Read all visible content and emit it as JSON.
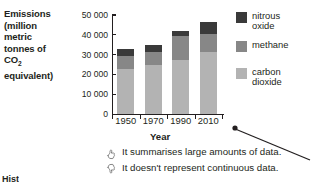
{
  "chart_data": {
    "type": "bar",
    "stacked": true,
    "title": "",
    "xlabel": "Year",
    "ylabel": "Emissions (million metric tonnes of CO2 equivalent)",
    "categories": [
      "1950",
      "1970",
      "1990",
      "2010"
    ],
    "series": [
      {
        "name": "carbon dioxide",
        "color": "#b3b3b3",
        "values": [
          22500,
          25000,
          27500,
          31500
        ]
      },
      {
        "name": "methane",
        "color": "#878787",
        "values": [
          7000,
          6500,
          12000,
          9000
        ]
      },
      {
        "name": "nitrous oxide",
        "color": "#3a3a3a",
        "values": [
          3500,
          3500,
          2500,
          6000
        ]
      }
    ],
    "totals": [
      33000,
      35000,
      42000,
      46500
    ],
    "ylim": [
      0,
      50000
    ],
    "ytick_values": [
      0,
      10000,
      20000,
      30000,
      40000,
      50000
    ],
    "ytick_labels": [
      "0",
      "10 000",
      "20 000",
      "30 000",
      "40 000",
      "50 000"
    ],
    "grid": false,
    "legend_position": "right"
  },
  "axis_title_y": {
    "line1": "Emissions",
    "line2": "(million",
    "line3": "metric",
    "line4": "tonnes of",
    "line5_pre": "CO",
    "line5_sub": "2",
    "line6": "equivalent)"
  },
  "axis_title_x": "Year",
  "legend": {
    "items": [
      {
        "label_line1": "nitrous",
        "label_line2": "oxide",
        "color": "#3a3a3a",
        "swatch_name": "legend-swatch-nitrous-oxide"
      },
      {
        "label_line1": "methane",
        "label_line2": "",
        "color": "#878787",
        "swatch_name": "legend-swatch-methane"
      },
      {
        "label_line1": "carbon",
        "label_line2": "dioxide",
        "color": "#b3b3b3",
        "swatch_name": "legend-swatch-carbon-dioxide"
      }
    ]
  },
  "notes": [
    {
      "icon": "thumbs-up-icon",
      "text": "It summarises large amounts of data."
    },
    {
      "icon": "thumbs-down-icon",
      "text": "It doesn't represent continuous data."
    }
  ],
  "annotation": {
    "type": "callout-arrow",
    "points_to": "chart"
  },
  "cutoff_text": "Hist"
}
